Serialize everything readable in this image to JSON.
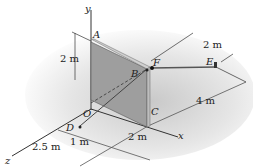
{
  "figure": {
    "type": "statics-3d-diagram",
    "axes": {
      "x": "x",
      "y": "y",
      "z": "z"
    },
    "points": {
      "A": "A",
      "B": "B",
      "C": "C",
      "D": "D",
      "E": "E",
      "F": "F",
      "O": "O"
    },
    "dimensions": {
      "plate_height": "2 m",
      "e_offset": "2 m",
      "ce_length": "4 m",
      "d_z": "2.5 m",
      "d_offset": "1 m",
      "x_spacing": "2 m"
    },
    "colors": {
      "plate_face": "#9a9a9a",
      "plate_edge": "#c4c4c4",
      "shadow": "#d8d8d8",
      "line": "#3a3a3a"
    }
  }
}
